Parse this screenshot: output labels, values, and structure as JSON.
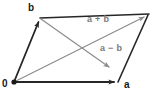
{
  "figure": {
    "type": "vector-diagram",
    "width": 159,
    "height": 95,
    "background_color": "#ffffff"
  },
  "labels": {
    "origin": "0",
    "vector_a": "a",
    "vector_b": "b",
    "sum": "a + b",
    "difference": "a − b"
  },
  "colors": {
    "edge_stroke": "#262626",
    "diagonal_stroke": "#8c8c8c",
    "vertex_label": "#1a1a1a",
    "diagonal_label": "#7a7a7a"
  },
  "geometry": {
    "points": {
      "origin": [
        14,
        82
      ],
      "a": [
        118,
        82
      ],
      "b": [
        40,
        18
      ],
      "a_plus_b": [
        148,
        14
      ],
      "difference_arrow_tip": [
        112,
        69
      ]
    },
    "edges": [
      {
        "name": "vector-a",
        "from": "origin",
        "to": "a",
        "style": "dark",
        "arrow": true
      },
      {
        "name": "vector-b",
        "from": "origin",
        "to": "b",
        "style": "dark",
        "arrow": true
      },
      {
        "name": "edge-b-to-sum",
        "from": "b",
        "to": "a_plus_b",
        "style": "dark",
        "arrow": false
      },
      {
        "name": "edge-a-to-sum",
        "from": "a",
        "to": "a_plus_b",
        "style": "dark",
        "arrow": false
      }
    ],
    "diagonals": [
      {
        "name": "diagonal-sum",
        "from": "origin",
        "to": "a_plus_b",
        "style": "gray",
        "arrow": true
      },
      {
        "name": "diagonal-difference",
        "from": "b",
        "to": "difference_arrow_tip",
        "style": "gray",
        "arrow": true
      }
    ]
  }
}
